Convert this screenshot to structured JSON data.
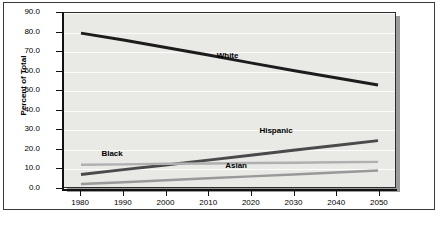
{
  "chart_data": {
    "type": "line",
    "title": "",
    "subtitle": "",
    "xlabel": "",
    "ylabel": "Percent of Total",
    "x": [
      1980,
      1990,
      2000,
      2010,
      2020,
      2030,
      2040,
      2050
    ],
    "xlim": [
      1976,
      2054
    ],
    "ylim": [
      0.0,
      90.0
    ],
    "ytick_step": 10.0,
    "xtick_labels": [
      "1980",
      "1990",
      "2000",
      "2010",
      "2020",
      "2030",
      "2040",
      "2050"
    ],
    "ytick_labels": [
      "0.0",
      "10.0",
      "20.0",
      "30.0",
      "40.0",
      "50.0",
      "60.0",
      "70.0",
      "80.0",
      "90.0"
    ],
    "grid": true,
    "grid_axis": "y",
    "legend_position": "inline-labels",
    "series": [
      {
        "name": "White",
        "color": "#1c1c1c",
        "width": 3.0,
        "label_x": 2012,
        "label_y": 67.5,
        "values": [
          79.6,
          76.0,
          72.2,
          68.3,
          64.2,
          60.3,
          56.5,
          52.8
        ]
      },
      {
        "name": "Hispanic",
        "color": "#4a4a4a",
        "width": 3.0,
        "label_x": 2022,
        "label_y": 29.0,
        "values": [
          6.5,
          9.0,
          11.4,
          13.9,
          16.4,
          19.0,
          21.5,
          24.0
        ]
      },
      {
        "name": "Black",
        "color": "#b0b0b0",
        "width": 2.5,
        "label_x": 1985,
        "label_y": 17.5,
        "values": [
          11.5,
          11.7,
          12.0,
          12.2,
          12.4,
          12.6,
          12.8,
          13.0
        ]
      },
      {
        "name": "Asian",
        "color": "#999999",
        "width": 2.5,
        "label_x": 2014,
        "label_y": 11.5,
        "values": [
          1.5,
          2.5,
          3.5,
          4.5,
          5.5,
          6.5,
          7.5,
          8.5
        ]
      }
    ]
  },
  "colors": {
    "plot_background": "#e9e9e6",
    "page_background": "#ffffff",
    "axis": "#111111",
    "frame_border": "#3a3a3a",
    "gridline": "#fbfbfa",
    "shadow": "#9a9a9a"
  }
}
